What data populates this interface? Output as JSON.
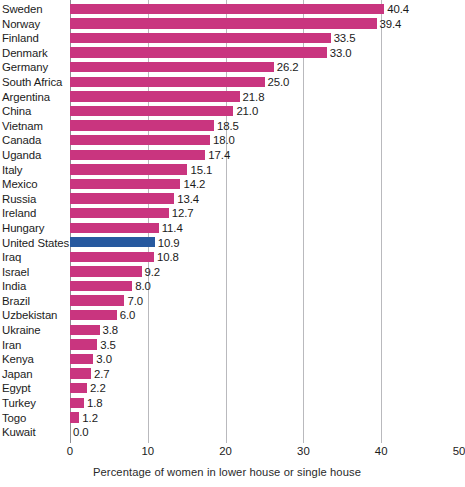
{
  "chart": {
    "axis_title": "Percentage of women in lower house or single house",
    "x_ticks": [
      "0",
      "10",
      "20",
      "30",
      "40",
      "50"
    ],
    "bar_color": "#c9357f",
    "highlight_color": "#27599f",
    "highlight_category": "United States"
  },
  "chart_data": {
    "type": "bar",
    "orientation": "horizontal",
    "title": "",
    "subtitle": "",
    "xlabel": "Percentage of women in lower house or single house",
    "ylabel": "",
    "xlim": [
      0,
      50
    ],
    "xticks": [
      0,
      10,
      20,
      30,
      40,
      50
    ],
    "grid": true,
    "legend": false,
    "categories": [
      "Sweden",
      "Norway",
      "Finland",
      "Denmark",
      "Germany",
      "South Africa",
      "Argentina",
      "China",
      "Vietnam",
      "Canada",
      "Uganda",
      "Italy",
      "Mexico",
      "Russia",
      "Ireland",
      "Hungary",
      "United States",
      "Iraq",
      "Israel",
      "India",
      "Brazil",
      "Uzbekistan",
      "Ukraine",
      "Iran",
      "Kenya",
      "Japan",
      "Egypt",
      "Turkey",
      "Togo",
      "Kuwait"
    ],
    "values": [
      40.4,
      39.4,
      33.5,
      33.0,
      26.2,
      25.0,
      21.8,
      21.0,
      18.5,
      18.0,
      17.4,
      15.1,
      14.2,
      13.4,
      12.7,
      11.4,
      10.9,
      10.8,
      9.2,
      8.0,
      7.0,
      6.0,
      3.8,
      3.5,
      3.0,
      2.7,
      2.2,
      1.8,
      1.2,
      0.0
    ],
    "value_labels": [
      "40.4",
      "39.4",
      "33.5",
      "33.0",
      "26.2",
      "25.0",
      "21.8",
      "21.0",
      "18.5",
      "18.0",
      "17.4",
      "15.1",
      "14.2",
      "13.4",
      "12.7",
      "11.4",
      "10.9",
      "10.8",
      "9.2",
      "8.0",
      "7.0",
      "6.0",
      "3.8",
      "3.5",
      "3.0",
      "2.7",
      "2.2",
      "1.8",
      "1.2",
      "0.0"
    ],
    "highlighted": [
      "United States"
    ]
  }
}
